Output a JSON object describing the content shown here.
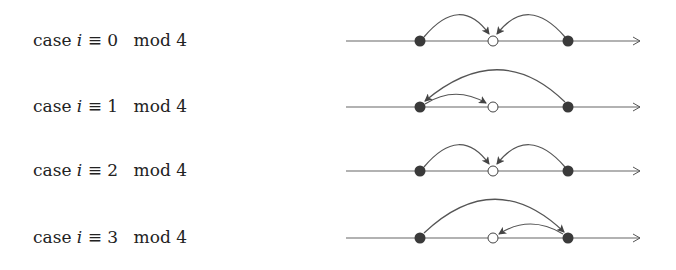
{
  "rows": [
    {
      "word": "case",
      "var": "i",
      "rel": "≡",
      "value": "0",
      "mod": "mod",
      "modulus": "4",
      "arcs": [
        {
          "from": "left",
          "to": "mid"
        },
        {
          "from": "right",
          "to": "mid"
        }
      ]
    },
    {
      "word": "case",
      "var": "i",
      "rel": "≡",
      "value": "1",
      "mod": "mod",
      "modulus": "4",
      "arcs": [
        {
          "from": "left",
          "to": "mid"
        },
        {
          "from": "right",
          "to": "left"
        }
      ]
    },
    {
      "word": "case",
      "var": "i",
      "rel": "≡",
      "value": "2",
      "mod": "mod",
      "modulus": "4",
      "arcs": [
        {
          "from": "left",
          "to": "mid"
        },
        {
          "from": "right",
          "to": "mid"
        }
      ]
    },
    {
      "word": "case",
      "var": "i",
      "rel": "≡",
      "value": "3",
      "mod": "mod",
      "modulus": "4",
      "arcs": [
        {
          "from": "left",
          "to": "right"
        },
        {
          "from": "right",
          "to": "mid"
        }
      ]
    }
  ],
  "nodes": {
    "left": "filled",
    "mid": "open",
    "right": "filled"
  },
  "colors": {
    "line": "#555555",
    "filled_node": "#3a3a3a",
    "open_node_fill": "#ffffff",
    "text": "#222222"
  }
}
